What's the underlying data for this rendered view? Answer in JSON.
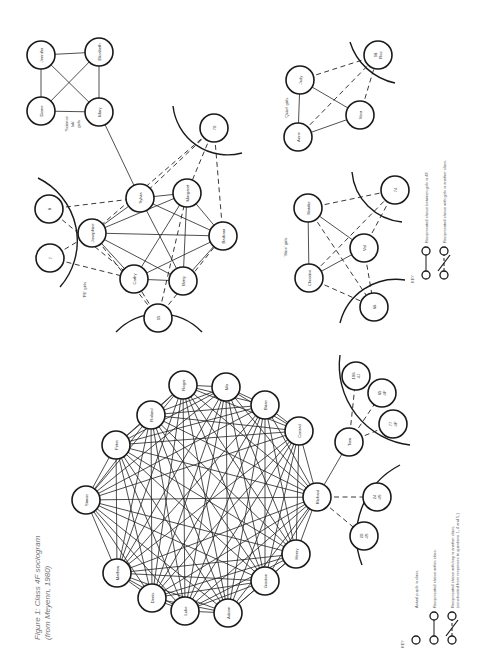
{
  "caption": {
    "line1": "Figure 1: Class 4F sociogram",
    "line2": "(from Meyenn, 1980)"
  },
  "colors": {
    "ink": "#1a1a1a",
    "text": "#333333",
    "caption": "#777777"
  },
  "girls": {
    "groups": [
      {
        "label": "'Science lab' girls",
        "lines": [
          "'Science",
          "lab'",
          "girls"
        ],
        "x": 68,
        "y": 124
      },
      {
        "label": "'PE' girls",
        "lines": [
          "'PE' girls"
        ],
        "x": 86,
        "y": 290
      },
      {
        "label": "'Quiet' girls",
        "lines": [
          "'Quiet' girls"
        ],
        "x": 288,
        "y": 108
      },
      {
        "label": "'Nice' girls",
        "lines": [
          "'Nice' girls"
        ],
        "x": 287,
        "y": 247
      }
    ],
    "nodes": [
      {
        "id": "jennifer",
        "label": "Jennifer",
        "x": 41,
        "y": 55,
        "r": 14
      },
      {
        "id": "elizabeth",
        "label": "Elizabeth",
        "x": 99,
        "y": 52,
        "r": 14
      },
      {
        "id": "diane",
        "label": "Diane",
        "x": 41,
        "y": 111,
        "r": 14
      },
      {
        "id": "mary",
        "label": "Mary",
        "x": 99,
        "y": 112,
        "r": 14
      },
      {
        "id": "g70",
        "label": "70",
        "x": 214,
        "y": 128,
        "r": 14
      },
      {
        "id": "g8",
        "label": "8",
        "x": 49,
        "y": 209,
        "r": 14
      },
      {
        "id": "g7",
        "label": "7",
        "x": 50,
        "y": 258,
        "r": 14
      },
      {
        "id": "josephine",
        "label": "Josephine",
        "x": 92,
        "y": 233,
        "r": 14
      },
      {
        "id": "sylvia",
        "label": "Sylvia",
        "x": 140,
        "y": 198,
        "r": 14
      },
      {
        "id": "margaret",
        "label": "Margaret",
        "x": 187,
        "y": 193,
        "r": 14
      },
      {
        "id": "barbara",
        "label": "Barbara",
        "x": 223,
        "y": 236,
        "r": 14
      },
      {
        "id": "betty",
        "label": "Betty",
        "x": 183,
        "y": 281,
        "r": 14
      },
      {
        "id": "cathy",
        "label": "Cathy",
        "x": 134,
        "y": 279,
        "r": 14
      },
      {
        "id": "g95",
        "label": "95",
        "x": 158,
        "y": 318,
        "r": 14
      },
      {
        "id": "judy",
        "label": "Judy",
        "x": 300,
        "y": 80,
        "r": 14
      },
      {
        "id": "anne",
        "label": "Anne",
        "x": 298,
        "y": 137,
        "r": 14
      },
      {
        "id": "vera",
        "label": "Vera",
        "x": 360,
        "y": 115,
        "r": 14
      },
      {
        "id": "roz",
        "label": "98 Roz",
        "x": 378,
        "y": 55,
        "r": 14
      },
      {
        "id": "natalie",
        "label": "Natalie",
        "x": 308,
        "y": 208,
        "r": 14
      },
      {
        "id": "christine",
        "label": "Christine",
        "x": 309,
        "y": 278,
        "r": 14
      },
      {
        "id": "val",
        "label": "Val",
        "x": 364,
        "y": 248,
        "r": 14
      },
      {
        "id": "g74",
        "label": "74",
        "x": 395,
        "y": 190,
        "r": 14
      },
      {
        "id": "g66",
        "label": "66",
        "x": 374,
        "y": 307,
        "r": 14
      }
    ],
    "edges": [
      [
        "jennifer",
        "elizabeth",
        "s"
      ],
      [
        "jennifer",
        "diane",
        "s"
      ],
      [
        "jennifer",
        "mary",
        "s"
      ],
      [
        "elizabeth",
        "diane",
        "s"
      ],
      [
        "elizabeth",
        "mary",
        "s"
      ],
      [
        "diane",
        "mary",
        "s"
      ],
      [
        "mary",
        "sylvia",
        "s"
      ],
      [
        "josephine",
        "sylvia",
        "s"
      ],
      [
        "josephine",
        "margaret",
        "s"
      ],
      [
        "josephine",
        "barbara",
        "s"
      ],
      [
        "josephine",
        "betty",
        "s"
      ],
      [
        "josephine",
        "cathy",
        "s"
      ],
      [
        "sylvia",
        "margaret",
        "s"
      ],
      [
        "sylvia",
        "barbara",
        "s"
      ],
      [
        "sylvia",
        "betty",
        "s"
      ],
      [
        "margaret",
        "barbara",
        "s"
      ],
      [
        "margaret",
        "cathy",
        "s"
      ],
      [
        "margaret",
        "betty",
        "s"
      ],
      [
        "barbara",
        "betty",
        "s"
      ],
      [
        "barbara",
        "cathy",
        "s"
      ],
      [
        "cathy",
        "betty",
        "s"
      ],
      [
        "g8",
        "sylvia",
        "d"
      ],
      [
        "g8",
        "cathy",
        "d"
      ],
      [
        "g7",
        "josephine",
        "d"
      ],
      [
        "g7",
        "cathy",
        "d"
      ],
      [
        "g70",
        "sylvia",
        "d"
      ],
      [
        "g70",
        "josephine",
        "d"
      ],
      [
        "g70",
        "margaret",
        "d"
      ],
      [
        "g70",
        "barbara",
        "d"
      ],
      [
        "g95",
        "josephine",
        "d"
      ],
      [
        "g95",
        "margaret",
        "d"
      ],
      [
        "g95",
        "barbara",
        "d"
      ],
      [
        "g95",
        "cathy",
        "d"
      ],
      [
        "judy",
        "anne",
        "s"
      ],
      [
        "judy",
        "vera",
        "s"
      ],
      [
        "anne",
        "vera",
        "s"
      ],
      [
        "judy",
        "roz",
        "d"
      ],
      [
        "anne",
        "roz",
        "d"
      ],
      [
        "vera",
        "roz",
        "d"
      ],
      [
        "natalie",
        "christine",
        "s"
      ],
      [
        "natalie",
        "val",
        "s"
      ],
      [
        "christine",
        "val",
        "s"
      ],
      [
        "natalie",
        "g74",
        "d"
      ],
      [
        "christine",
        "g74",
        "d"
      ],
      [
        "val",
        "g74",
        "d"
      ],
      [
        "christine",
        "g66",
        "d"
      ],
      [
        "natalie",
        "g66",
        "d"
      ],
      [
        "val",
        "g66",
        "d"
      ]
    ],
    "arcs": [
      {
        "d": "M 38 178 A 70 70 0 0 1 60 287"
      },
      {
        "d": "M 116 332 A 60 60 0 0 1 202 332"
      },
      {
        "d": "M 173 106 A 55 55 0 0 0 242 153"
      },
      {
        "d": "M 350 42 A 60 60 0 0 0 395 83"
      },
      {
        "d": "M 352 172 A 55 55 0 0 0 402 222"
      },
      {
        "d": "M 340 323 A 58 58 0 0 1 405 280"
      }
    ],
    "key": {
      "title": "KEY",
      "items": [
        {
          "type": "solid",
          "text": "Reciprocated choice between girls in 4F."
        },
        {
          "type": "dashed",
          "text": "Reciprocated choice with girls in another class."
        }
      ],
      "x": 414,
      "y": 275
    }
  },
  "boys": {
    "nodes": [
      {
        "id": "simon",
        "label": "Simon",
        "x": 86,
        "y": 500,
        "r": 14
      },
      {
        "id": "peter",
        "label": "Peter",
        "x": 116,
        "y": 445,
        "r": 14
      },
      {
        "id": "roland",
        "label": "Roland",
        "x": 151,
        "y": 415,
        "r": 14
      },
      {
        "id": "roger",
        "label": "Roger",
        "x": 183,
        "y": 385,
        "r": 14
      },
      {
        "id": "mo",
        "label": "Mo",
        "x": 226,
        "y": 387,
        "r": 14
      },
      {
        "id": "brian",
        "label": "Brian",
        "x": 265,
        "y": 405,
        "r": 14
      },
      {
        "id": "conrad",
        "label": "Conrad",
        "x": 299,
        "y": 431,
        "r": 14
      },
      {
        "id": "richard",
        "label": "Richard",
        "x": 317,
        "y": 497,
        "r": 14
      },
      {
        "id": "henry",
        "label": "Henry",
        "x": 296,
        "y": 554,
        "r": 14
      },
      {
        "id": "gordon",
        "label": "Gordon",
        "x": 265,
        "y": 581,
        "r": 14
      },
      {
        "id": "adrian",
        "label": "Adrian",
        "x": 228,
        "y": 613,
        "r": 14
      },
      {
        "id": "luke",
        "label": "Luke",
        "x": 185,
        "y": 611,
        "r": 14
      },
      {
        "id": "denis",
        "label": "Denis",
        "x": 152,
        "y": 598,
        "r": 14
      },
      {
        "id": "mathew",
        "label": "Mathew",
        "x": 117,
        "y": 573,
        "r": 14
      },
      {
        "id": "tom",
        "label": "Tom",
        "x": 349,
        "y": 442,
        "r": 14
      },
      {
        "id": "b106",
        "label": "106 4J",
        "x": 356,
        "y": 376,
        "r": 14
      },
      {
        "id": "b65",
        "label": "65 4F",
        "x": 382,
        "y": 393,
        "r": 14
      },
      {
        "id": "b77",
        "label": "77 4F",
        "x": 393,
        "y": 424,
        "r": 14
      },
      {
        "id": "b24",
        "label": "24 4S",
        "x": 377,
        "y": 497,
        "r": 14
      },
      {
        "id": "b20",
        "label": "20 4S",
        "x": 364,
        "y": 536,
        "r": 14
      }
    ],
    "clique": [
      "simon",
      "peter",
      "roland",
      "roger",
      "mo",
      "brian",
      "conrad",
      "richard",
      "henry",
      "gordon",
      "adrian",
      "luke",
      "denis",
      "mathew"
    ],
    "edges": [
      [
        "richard",
        "tom",
        "s"
      ],
      [
        "tom",
        "b106",
        "d"
      ],
      [
        "tom",
        "b65",
        "d"
      ],
      [
        "tom",
        "b77",
        "d"
      ],
      [
        "richard",
        "b24",
        "d"
      ],
      [
        "richard",
        "b20",
        "d"
      ]
    ],
    "arcs": [
      {
        "d": "M 340 355 A 80 80 0 0 0 410 445"
      },
      {
        "d": "M 400 465 A 80 80 0 0 0 362 565"
      }
    ],
    "key": {
      "title": "KEY",
      "items": [
        {
          "type": "single",
          "text": "Actual pupils in class."
        },
        {
          "type": "solid",
          "text": "Reciprocated choice within class."
        },
        {
          "type": "cross",
          "text": "Reciprocated choice with boy in another class.",
          "text2": "(constructed from responses to questions 1, 4 and 5.)"
        }
      ],
      "x": 404,
      "y": 640
    }
  }
}
